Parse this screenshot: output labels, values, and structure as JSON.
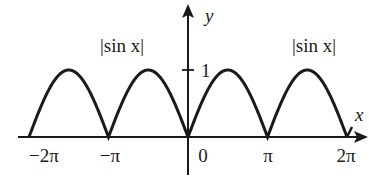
{
  "chart_data": {
    "type": "line",
    "title": "",
    "function": "|sin x|",
    "series": [
      {
        "name": "|sin x|",
        "x_range": [
          -6.2832,
          6.2832
        ]
      }
    ],
    "xlabel": "x",
    "ylabel": "y",
    "x_ticks": [
      "−2π",
      "−π",
      "0",
      "π",
      "2π"
    ],
    "x_tick_values": [
      -6.2832,
      -3.1416,
      0,
      3.1416,
      6.2832
    ],
    "y_ticks": [
      "1"
    ],
    "y_tick_values": [
      1
    ],
    "xlim": [
      -6.9,
      7.0
    ],
    "ylim": [
      0,
      1.9
    ],
    "annotations": [
      {
        "text": "|sin x|",
        "position": "above left arch"
      },
      {
        "text": "|sin x|",
        "position": "above right arch"
      }
    ],
    "grid": false,
    "legend": "none"
  },
  "labels": {
    "annot_left": "|sin x|",
    "annot_right": "|sin x|",
    "x_axis": "x",
    "y_axis": "y",
    "tick_neg2pi": "−2π",
    "tick_negpi": "−π",
    "tick_zero": "0",
    "tick_pi": "π",
    "tick_2pi": "2π",
    "tick_one": "1"
  }
}
